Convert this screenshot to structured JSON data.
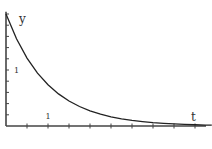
{
  "chart_data": {
    "type": "line",
    "title": "",
    "xlabel": "t",
    "ylabel": "y",
    "xlim": [
      0,
      4.9
    ],
    "ylim": [
      0,
      2.04
    ],
    "x_tick_step": 0.5,
    "y_tick_step": 0.2,
    "x_tick_labels": [
      {
        "value": 1,
        "text": "1"
      }
    ],
    "y_tick_labels": [
      {
        "value": 1,
        "text": "1"
      }
    ],
    "grid": false,
    "legend": "none",
    "series": [
      {
        "name": "y = 2e^(-t)",
        "formula": "2*exp(-t)",
        "x": [
          0,
          0.25,
          0.5,
          0.75,
          1,
          1.25,
          1.5,
          1.75,
          2,
          2.25,
          2.5,
          2.75,
          3,
          3.25,
          3.5,
          3.75,
          4,
          4.25,
          4.5,
          4.75,
          4.9
        ],
        "values": [
          2.0,
          1.558,
          1.213,
          0.945,
          0.736,
          0.573,
          0.446,
          0.348,
          0.271,
          0.211,
          0.164,
          0.128,
          0.1,
          0.078,
          0.06,
          0.047,
          0.037,
          0.029,
          0.022,
          0.017,
          0.015
        ],
        "color": "#222222"
      }
    ]
  }
}
